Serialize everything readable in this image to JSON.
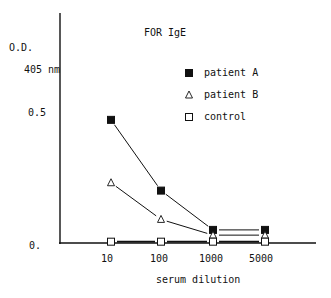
{
  "chart_data": {
    "type": "line",
    "title": "FOR IgE",
    "xlabel": "serum dilution",
    "ylabel": "O.D. 405 nm",
    "ylabel_line1": "O.D.",
    "ylabel_line2": "405 nm",
    "x_scale": "categorical (log-like)",
    "categories": [
      "10",
      "100",
      "1000",
      "5000"
    ],
    "y_ticks": [
      "0.",
      "0.5"
    ],
    "ylim": [
      0,
      0.75
    ],
    "grid": false,
    "legend_position": "upper right",
    "series": [
      {
        "name": "patient A",
        "marker": "filled-square",
        "values": [
          0.47,
          0.2,
          0.05,
          0.05
        ]
      },
      {
        "name": "patient B",
        "marker": "open-triangle",
        "values": [
          0.23,
          0.09,
          0.03,
          0.03
        ]
      },
      {
        "name": "control",
        "marker": "open-square",
        "values": [
          0.005,
          0.005,
          0.005,
          0.005
        ]
      }
    ]
  },
  "labels": {
    "title": "FOR IgE",
    "y_line1": "O.D.",
    "y_line2": "405 nm",
    "y_tick_05": "0.5",
    "y_tick_0": "0.",
    "x_ticks": [
      "10",
      "100",
      "1000",
      "5000"
    ],
    "xlabel": "serum dilution",
    "legend": [
      "patient A",
      "patient B",
      "control"
    ]
  }
}
